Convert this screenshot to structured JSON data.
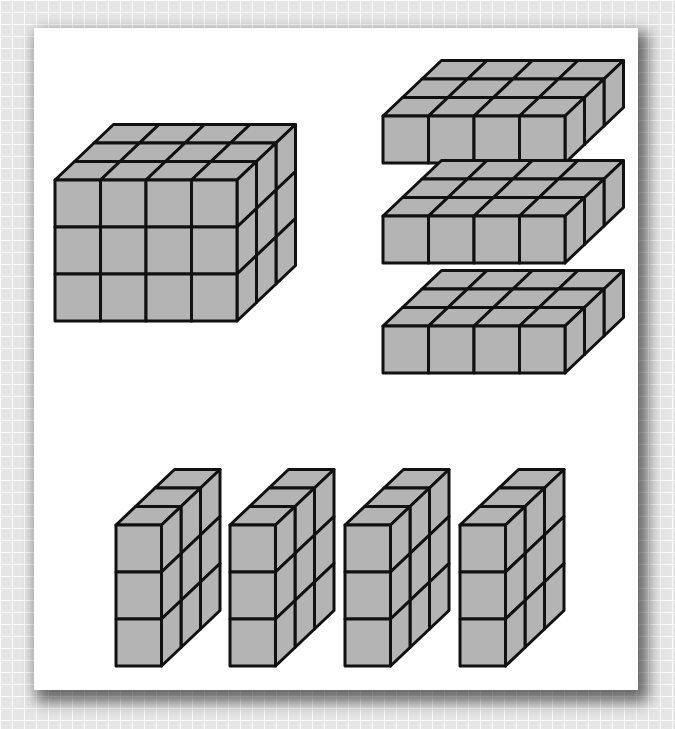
{
  "figure": {
    "colors": {
      "face_fill": "#b4b4b4",
      "edge": "#111111",
      "card": "#ffffff",
      "background": "#e6e6e6"
    },
    "cell": {
      "w": 45.5,
      "h": 47,
      "dx": 19.5,
      "dy": -18.5
    },
    "solids": [
      {
        "name": "full-block",
        "x": 55,
        "y": 180,
        "cols": 4,
        "rows": 3,
        "depth": 3
      },
      {
        "name": "horizontal-slab-1",
        "x": 383,
        "y": 116,
        "cols": 4,
        "rows": 1,
        "depth": 3
      },
      {
        "name": "horizontal-slab-2",
        "x": 383,
        "y": 216,
        "cols": 4,
        "rows": 1,
        "depth": 3
      },
      {
        "name": "horizontal-slab-3",
        "x": 383,
        "y": 326,
        "cols": 4,
        "rows": 1,
        "depth": 3
      },
      {
        "name": "vertical-slab-1",
        "x": 116,
        "y": 525,
        "cols": 1,
        "rows": 3,
        "depth": 3
      },
      {
        "name": "vertical-slab-2",
        "x": 230,
        "y": 525,
        "cols": 1,
        "rows": 3,
        "depth": 3
      },
      {
        "name": "vertical-slab-3",
        "x": 345,
        "y": 525,
        "cols": 1,
        "rows": 3,
        "depth": 3
      },
      {
        "name": "vertical-slab-4",
        "x": 460,
        "y": 525,
        "cols": 1,
        "rows": 3,
        "depth": 3
      }
    ]
  }
}
